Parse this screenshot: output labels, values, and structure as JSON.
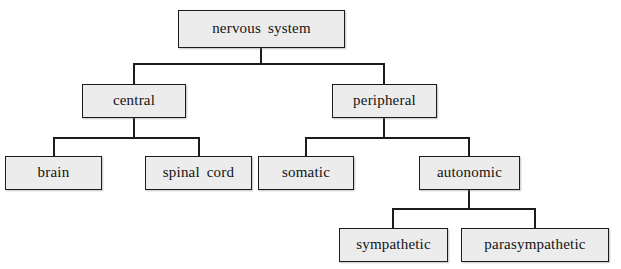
{
  "diagram": {
    "type": "tree",
    "background_color": "#ffffff",
    "box_fill_color": "#ececec",
    "box_border_color": "#1c1c1c",
    "connector_color": "#1c1c1c",
    "nodes": [
      {
        "id": "nervous-system",
        "label": "nervous system",
        "level": 0,
        "x": 178,
        "y": 10,
        "w": 167,
        "h": 38
      },
      {
        "id": "central",
        "label": "central",
        "level": 1,
        "parent": "nervous-system",
        "x": 82,
        "y": 84,
        "w": 104,
        "h": 34
      },
      {
        "id": "peripheral",
        "label": "peripheral",
        "level": 1,
        "parent": "nervous-system",
        "x": 332,
        "y": 84,
        "w": 105,
        "h": 34
      },
      {
        "id": "brain",
        "label": "brain",
        "level": 2,
        "parent": "central",
        "x": 5,
        "y": 156,
        "w": 97,
        "h": 34
      },
      {
        "id": "spinal-cord",
        "label": "spinal cord",
        "level": 2,
        "parent": "central",
        "x": 145,
        "y": 156,
        "w": 107,
        "h": 34
      },
      {
        "id": "somatic",
        "label": "somatic",
        "level": 2,
        "parent": "peripheral",
        "x": 258,
        "y": 156,
        "w": 96,
        "h": 34
      },
      {
        "id": "autonomic",
        "label": "autonomic",
        "level": 2,
        "parent": "peripheral",
        "x": 419,
        "y": 156,
        "w": 101,
        "h": 34
      },
      {
        "id": "sympathetic",
        "label": "sympathetic",
        "level": 3,
        "parent": "autonomic",
        "x": 339,
        "y": 228,
        "w": 109,
        "h": 34
      },
      {
        "id": "parasympathetic",
        "label": "parasympathetic",
        "level": 3,
        "parent": "autonomic",
        "x": 461,
        "y": 228,
        "w": 148,
        "h": 34
      }
    ],
    "connectors": [
      {
        "id": "root-stem",
        "orient": "v",
        "x": 260,
        "y": 48,
        "len": 16
      },
      {
        "id": "root-bus",
        "orient": "h",
        "x": 133,
        "y": 63,
        "len": 252
      },
      {
        "id": "central-riser",
        "orient": "v",
        "x": 133,
        "y": 63,
        "len": 22
      },
      {
        "id": "peripheral-riser",
        "orient": "v",
        "x": 383,
        "y": 63,
        "len": 22
      },
      {
        "id": "central-stem",
        "orient": "v",
        "x": 133,
        "y": 118,
        "len": 20
      },
      {
        "id": "central-bus",
        "orient": "h",
        "x": 53,
        "y": 137,
        "len": 147
      },
      {
        "id": "brain-riser",
        "orient": "v",
        "x": 53,
        "y": 137,
        "len": 20
      },
      {
        "id": "spinal-riser",
        "orient": "v",
        "x": 198,
        "y": 137,
        "len": 20
      },
      {
        "id": "peripheral-stem",
        "orient": "v",
        "x": 383,
        "y": 118,
        "len": 20
      },
      {
        "id": "peripheral-bus",
        "orient": "h",
        "x": 305,
        "y": 137,
        "len": 165
      },
      {
        "id": "somatic-riser",
        "orient": "v",
        "x": 305,
        "y": 137,
        "len": 20
      },
      {
        "id": "autonomic-riser",
        "orient": "v",
        "x": 468,
        "y": 137,
        "len": 20
      },
      {
        "id": "autonomic-stem",
        "orient": "v",
        "x": 468,
        "y": 190,
        "len": 19
      },
      {
        "id": "autonomic-bus",
        "orient": "h",
        "x": 392,
        "y": 208,
        "len": 144
      },
      {
        "id": "sympathetic-riser",
        "orient": "v",
        "x": 392,
        "y": 208,
        "len": 21
      },
      {
        "id": "parasym-riser",
        "orient": "v",
        "x": 534,
        "y": 208,
        "len": 21
      }
    ]
  }
}
